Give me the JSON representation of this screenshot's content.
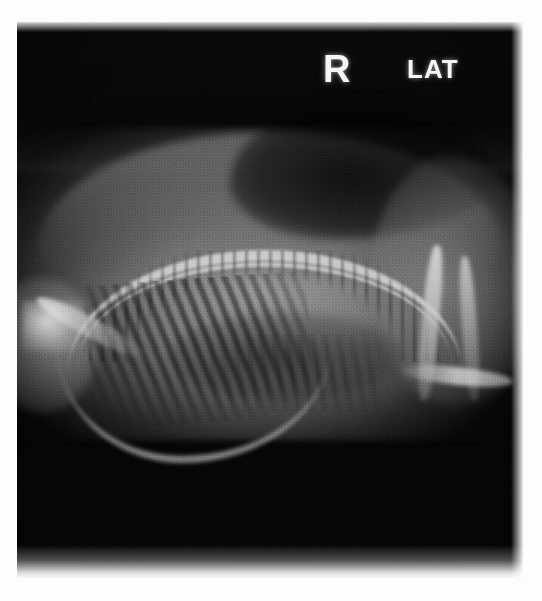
{
  "page": {
    "background_color": "#fdfdfd"
  },
  "radiograph": {
    "name": "lateral-radiograph",
    "modality": "X-ray",
    "view": "lateral",
    "description": "Grainy black-and-white lateral survey radiograph of a small animal showing the vertebral column, rib cage, thoracic and abdominal soft tissue, fore limb and hind limb bones.",
    "frame": {
      "left": 17,
      "top": 22,
      "width": 506,
      "height": 557
    },
    "colors": {
      "background": "#060606",
      "bone_bright": "#e1e1e1",
      "soft_tissue": "#8c8c8c",
      "gas_dark": "#0a0a0a",
      "marker_text": "#f6f6f6"
    },
    "markers": {
      "side_label": "R",
      "view_label": "LAT"
    },
    "anatomy_labels": [
      "vertebral-column",
      "rib-cage",
      "thoracic-soft-tissue",
      "abdominal-gas",
      "fore-limb",
      "hind-limb",
      "pelvis"
    ]
  },
  "caption": {
    "text": "",
    "note": "caption line cropped at bottom edge of page"
  }
}
